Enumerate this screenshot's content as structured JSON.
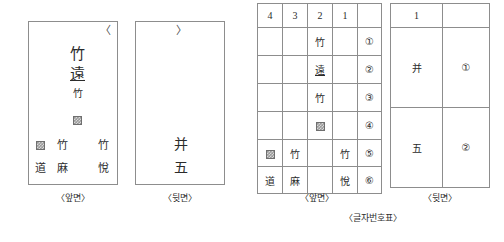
{
  "figure": {
    "caption": "〈글자번호표〉"
  },
  "tablets": [
    {
      "id": "front-tablet",
      "caption": "〈앞면〉",
      "bracket": "〈",
      "lines": [
        {
          "text": "竹",
          "size": 15,
          "underline": false
        },
        {
          "text": "遠",
          "size": 15,
          "underline": true
        },
        {
          "text": "竹",
          "size": 10,
          "underline": false
        }
      ],
      "marker_glyph": "damaged-box",
      "bottom_rows": [
        {
          "cells": [
            "damaged-box",
            "竹",
            "",
            "竹"
          ]
        },
        {
          "cells": [
            "道",
            "麻",
            "",
            "悅"
          ]
        }
      ]
    },
    {
      "id": "back-tablet",
      "caption": "〈뒷면〉",
      "bracket": "〉",
      "lines": [
        {
          "text": "并",
          "size": 14,
          "underline": false
        },
        {
          "text": "五",
          "size": 14,
          "underline": false
        }
      ]
    }
  ],
  "tables": [
    {
      "id": "front-index-table",
      "caption": "〈앞면〉",
      "columns": [
        "4",
        "3",
        "2",
        "1",
        ""
      ],
      "rows": [
        {
          "cells": [
            "",
            "",
            "竹",
            "",
            "①"
          ],
          "underline": [
            false,
            false,
            false,
            false,
            false
          ]
        },
        {
          "cells": [
            "",
            "",
            "遠",
            "",
            "②"
          ],
          "underline": [
            false,
            false,
            true,
            false,
            false
          ]
        },
        {
          "cells": [
            "",
            "",
            "竹",
            "",
            "③"
          ],
          "underline": [
            false,
            false,
            false,
            false,
            false
          ]
        },
        {
          "cells": [
            "",
            "",
            "damaged-box",
            "",
            "④"
          ],
          "underline": [
            false,
            false,
            false,
            false,
            false
          ]
        },
        {
          "cells": [
            "damaged-box",
            "竹",
            "",
            "竹",
            "⑤"
          ],
          "underline": [
            false,
            false,
            false,
            false,
            false
          ]
        },
        {
          "cells": [
            "道",
            "麻",
            "",
            "悅",
            "⑥"
          ],
          "underline": [
            false,
            false,
            false,
            false,
            false
          ]
        }
      ]
    },
    {
      "id": "back-index-table",
      "caption": "〈뒷면〉",
      "columns": [
        "1",
        ""
      ],
      "rows": [
        {
          "cells": [
            "并",
            "①"
          ]
        },
        {
          "cells": [
            "五",
            "②"
          ]
        }
      ]
    }
  ],
  "colors": {
    "border": "#8d8d8d",
    "text": "#2b2b2b",
    "caption": "#2f2f2f",
    "marker_fill": "#9a9a9a"
  }
}
